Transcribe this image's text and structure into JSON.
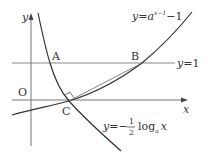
{
  "diagram": {
    "axes": {
      "x_label": "x",
      "y_label": "y",
      "origin_label": "O"
    },
    "points": {
      "A": "A",
      "B": "B",
      "C": "C"
    },
    "lines": {
      "horizontal_line_label": "y=1"
    },
    "curves": {
      "exponential": {
        "label_prefix": "y=a",
        "label_exponent": "x−1",
        "label_suffix": "−1"
      },
      "logarithmic": {
        "label_prefix": "y=−",
        "label_frac_num": "1",
        "label_frac_den": "2",
        "label_log": "log",
        "label_base": "a",
        "label_arg": "x"
      }
    },
    "colors": {
      "curve": "#333333",
      "axis": "#666666",
      "line": "#777777"
    }
  }
}
